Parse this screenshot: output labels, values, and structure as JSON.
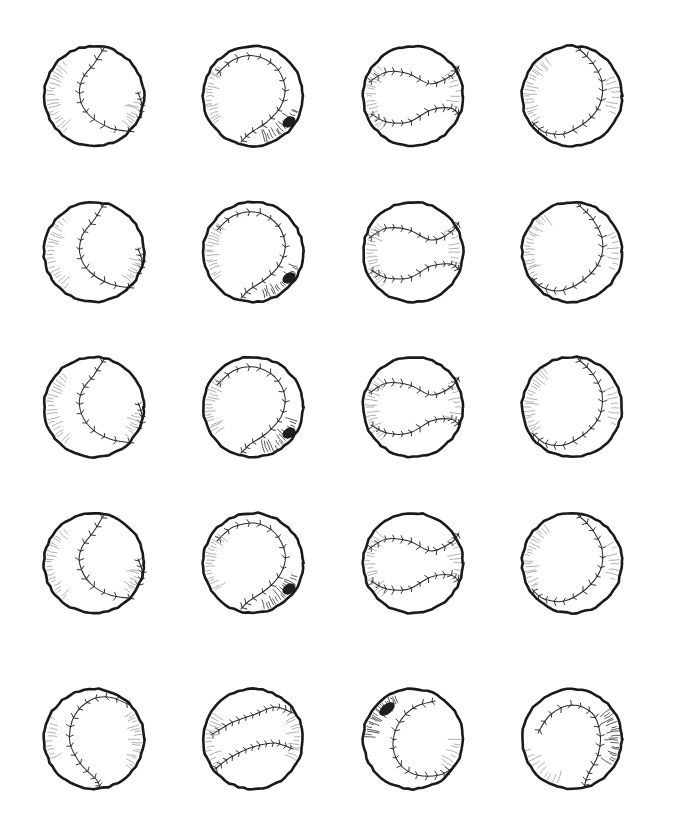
{
  "page": {
    "background_color": "#ffffff",
    "ink_color": "#1a1a1a",
    "shading_color": "#8d8d8d",
    "width": 673,
    "height": 835,
    "columns": 4,
    "rows": 5,
    "total_items": 20,
    "medium": "hand-drawn pen and ink line art"
  },
  "layout": {
    "column_centers": [
      94,
      253,
      413,
      572
    ],
    "row_centers": [
      96,
      252,
      407,
      563,
      739
    ],
    "ball_diameter": 108
  },
  "variants": [
    {
      "id": "seam-s-curve-vertical",
      "name": "Vertical S-curve seam",
      "description": "Single S-shaped seam running top to bottom with a second short seam arc at the right edge",
      "shading": "left-lower-edge hatching"
    },
    {
      "id": "seam-c-open-left",
      "name": "C-seam opening left",
      "description": "Seam sweeping from upper-left across the top and down the right side",
      "shading": "left edge and dark lower-right blob"
    },
    {
      "id": "seam-double-horizontal",
      "name": "Double horizontal seams",
      "description": "Two opposing horizontal S-curve seams, classic baseball face view",
      "shading": "left edge hatching"
    },
    {
      "id": "seam-c-open-right",
      "name": "C-seam opening right",
      "description": "Backwards C seam from top down the right side and across the bottom",
      "shading": "left edge hatching"
    },
    {
      "id": "seam-arc-left-open",
      "name": "Left arc seam",
      "description": "Wide arc seam from top-right curving down the left and to the bottom",
      "shading": "right edge hatching"
    },
    {
      "id": "seam-double-diagonal",
      "name": "Double diagonal seams",
      "description": "Two diagonal seams crossing the face from upper-right to lower-left",
      "shading": "left and right edge hatching"
    },
    {
      "id": "seam-c-dark-corner",
      "name": "C-seam with dark corner",
      "description": "C seam opening right with a heavy dark ink blob at the upper-left rim",
      "shading": "dark upper-left blob with hatching"
    },
    {
      "id": "seam-arch-right",
      "name": "Right arch seam",
      "description": "Arch seam across the top descending along the right side",
      "shading": "right edge hatching"
    }
  ],
  "grid": [
    {
      "row": 1,
      "cells": [
        {
          "label": "Baseball R1C1",
          "variant": "seam-s-curve-vertical"
        },
        {
          "label": "Baseball R1C2",
          "variant": "seam-c-open-left"
        },
        {
          "label": "Baseball R1C3",
          "variant": "seam-double-horizontal"
        },
        {
          "label": "Baseball R1C4",
          "variant": "seam-c-open-right"
        }
      ]
    },
    {
      "row": 2,
      "cells": [
        {
          "label": "Baseball R2C1",
          "variant": "seam-s-curve-vertical"
        },
        {
          "label": "Baseball R2C2",
          "variant": "seam-c-open-left"
        },
        {
          "label": "Baseball R2C3",
          "variant": "seam-double-horizontal"
        },
        {
          "label": "Baseball R2C4",
          "variant": "seam-c-open-right"
        }
      ]
    },
    {
      "row": 3,
      "cells": [
        {
          "label": "Baseball R3C1",
          "variant": "seam-s-curve-vertical"
        },
        {
          "label": "Baseball R3C2",
          "variant": "seam-c-open-left"
        },
        {
          "label": "Baseball R3C3",
          "variant": "seam-double-horizontal"
        },
        {
          "label": "Baseball R3C4",
          "variant": "seam-c-open-right"
        }
      ]
    },
    {
      "row": 4,
      "cells": [
        {
          "label": "Baseball R4C1",
          "variant": "seam-s-curve-vertical"
        },
        {
          "label": "Baseball R4C2",
          "variant": "seam-c-open-left"
        },
        {
          "label": "Baseball R4C3",
          "variant": "seam-double-horizontal"
        },
        {
          "label": "Baseball R4C4",
          "variant": "seam-c-open-right"
        }
      ]
    },
    {
      "row": 5,
      "cells": [
        {
          "label": "Baseball R5C1",
          "variant": "seam-arc-left-open"
        },
        {
          "label": "Baseball R5C2",
          "variant": "seam-double-diagonal"
        },
        {
          "label": "Baseball R5C3",
          "variant": "seam-c-dark-corner"
        },
        {
          "label": "Baseball R5C4",
          "variant": "seam-arch-right"
        }
      ]
    }
  ]
}
